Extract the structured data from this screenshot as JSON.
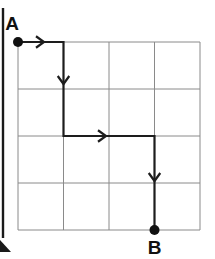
{
  "figure": {
    "background_color": "#ffffff",
    "width": 215,
    "height": 259
  },
  "grid": {
    "name": "4x4-lattice-grid",
    "columns": 4,
    "rows": 4,
    "left": 18,
    "top": 42,
    "right": 200,
    "bottom": 230,
    "cell_width": 45.5,
    "cell_height": 47,
    "line_color": "#8a8a8a",
    "line_width": 1,
    "x_lines": [
      18,
      63.5,
      109,
      154.5,
      200
    ],
    "y_lines": [
      42,
      89,
      136,
      183,
      230
    ]
  },
  "nodes": {
    "start": {
      "label": "A",
      "grid_x": 0,
      "grid_y": 0,
      "px_x": 18,
      "px_y": 42,
      "dot_radius": 5,
      "dot_color": "#111111",
      "label_px_x": 19,
      "label_px_y": 30,
      "label_anchor": "end"
    },
    "end": {
      "label": "B",
      "grid_x": 3,
      "grid_y": 4,
      "px_x": 154.5,
      "px_y": 230,
      "dot_radius": 5,
      "dot_color": "#111111",
      "label_px_x": 154.5,
      "label_px_y": 254,
      "label_anchor": "middle"
    }
  },
  "path": {
    "name": "route-a-to-b",
    "color": "#1d1d1d",
    "line_width": 2.2,
    "points_grid": [
      [
        0,
        0
      ],
      [
        1,
        0
      ],
      [
        1,
        2
      ],
      [
        3,
        2
      ],
      [
        3,
        4
      ]
    ],
    "points_px": [
      [
        18,
        42
      ],
      [
        63.5,
        42
      ],
      [
        63.5,
        136
      ],
      [
        154.5,
        136
      ],
      [
        154.5,
        230
      ]
    ],
    "segments": [
      {
        "name": "segment-right-1",
        "direction": "right",
        "from_px": [
          18,
          42
        ],
        "to_px": [
          63.5,
          42
        ],
        "length_cells": 1
      },
      {
        "name": "segment-down-1",
        "direction": "down",
        "from_px": [
          63.5,
          42
        ],
        "to_px": [
          63.5,
          136
        ],
        "length_cells": 2
      },
      {
        "name": "segment-right-2",
        "direction": "right",
        "from_px": [
          63.5,
          136
        ],
        "to_px": [
          154.5,
          136
        ],
        "length_cells": 2
      },
      {
        "name": "segment-down-2",
        "direction": "down",
        "from_px": [
          154.5,
          136
        ],
        "to_px": [
          154.5,
          230
        ],
        "length_cells": 2
      }
    ],
    "arrows": [
      {
        "name": "arrow-right-1",
        "direction": "right",
        "tip_px": [
          44,
          42
        ],
        "size": 8
      },
      {
        "name": "arrow-down-1",
        "direction": "down",
        "tip_px": [
          63.5,
          84
        ],
        "size": 8
      },
      {
        "name": "arrow-right-2",
        "direction": "right",
        "tip_px": [
          106,
          136
        ],
        "size": 8
      },
      {
        "name": "arrow-down-2",
        "direction": "down",
        "tip_px": [
          154.5,
          181
        ],
        "size": 8
      }
    ]
  },
  "page_edge": {
    "name": "scan-page-edge",
    "color": "#1a1a1a",
    "bar_x": 3,
    "bar_top": 8,
    "bar_bottom": 238,
    "bar_width": 2.4,
    "corner_points": "0,240 11,252 0,252"
  }
}
